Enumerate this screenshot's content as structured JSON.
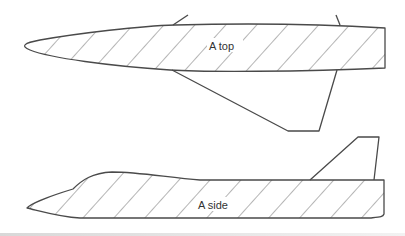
{
  "diagram": {
    "colors": {
      "stroke": "#4a4a4a",
      "hatch": "#5a5a5a",
      "background": "#ffffff"
    },
    "views": [
      {
        "id": "top",
        "label": "A top",
        "hatched": true,
        "description": "Top (plan) view of fuselage cross-section area with swept delta wing below"
      },
      {
        "id": "side",
        "label": "A side",
        "hatched": true,
        "description": "Side view of fuselage cross-section area with canopy bulge and vertical tail fin"
      }
    ]
  }
}
